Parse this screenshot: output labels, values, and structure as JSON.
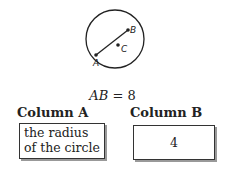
{
  "figure": {
    "points": {
      "A": "A",
      "B": "B",
      "C": "C"
    }
  },
  "given": {
    "lhs": "AB",
    "op": "=",
    "rhs": "8"
  },
  "columns": {
    "a_header": "Column A",
    "b_header": "Column B",
    "a_line1": "the radius",
    "a_line2": "of the circle",
    "b_value": "4"
  }
}
